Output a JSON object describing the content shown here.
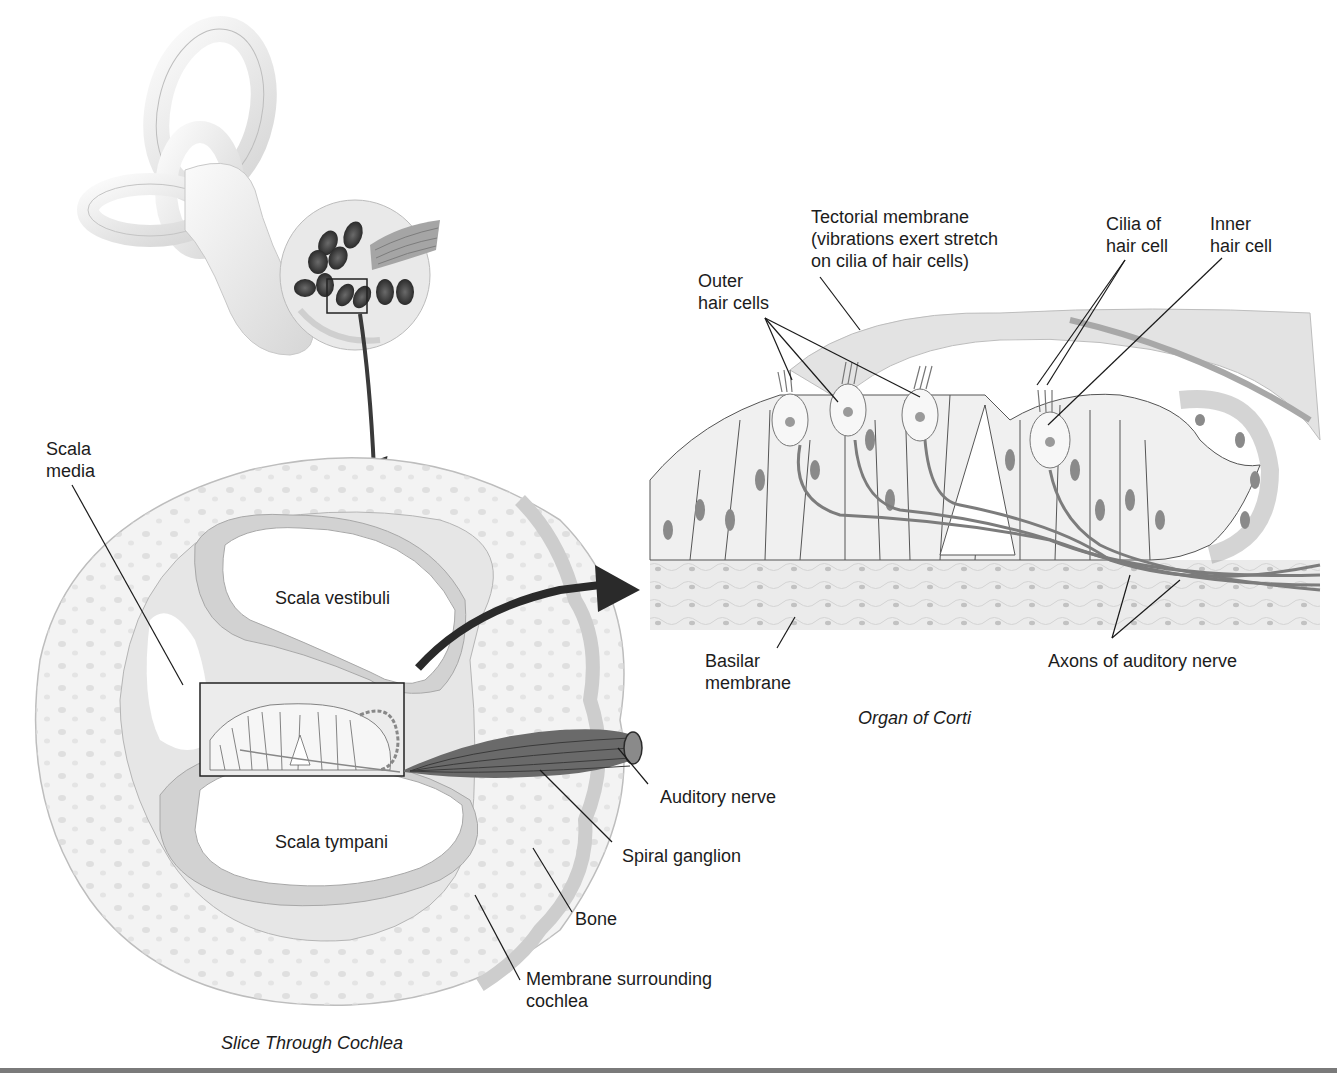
{
  "figure": {
    "colors": {
      "tissue": "#ececec",
      "tissue_dark": "#cfcfcf",
      "bone": "#f2f2f2",
      "arrow": "#2a2a2a",
      "nucleus": "#8a8a8a",
      "nerve": "#6e6e6e",
      "rule": "#7a7a7a"
    },
    "inner_ear": {
      "name": "Inner ear (labyrinth with cochlea)",
      "inset_box": "highlighted cochlear turn"
    },
    "slice_through_cochlea": {
      "caption": "Slice Through Cochlea",
      "labels": {
        "scala_media_1": "Scala",
        "scala_media_2": "media",
        "scala_vestibuli": "Scala vestibuli",
        "scala_tympani": "Scala tympani",
        "auditory_nerve": "Auditory nerve",
        "spiral_ganglion": "Spiral ganglion",
        "bone": "Bone",
        "membrane_1": "Membrane surrounding",
        "membrane_2": "cochlea"
      }
    },
    "organ_of_corti": {
      "caption": "Organ of Corti",
      "labels": {
        "tectorial_1": "Tectorial membrane",
        "tectorial_2": "(vibrations exert stretch",
        "tectorial_3": "on cilia of hair cells)",
        "cilia_1": "Cilia of",
        "cilia_2": "hair cell",
        "inner_1": "Inner",
        "inner_2": "hair cell",
        "outer_1": "Outer",
        "outer_2": "hair cells",
        "basilar_1": "Basilar",
        "basilar_2": "membrane",
        "axons": "Axons of auditory nerve"
      }
    }
  }
}
